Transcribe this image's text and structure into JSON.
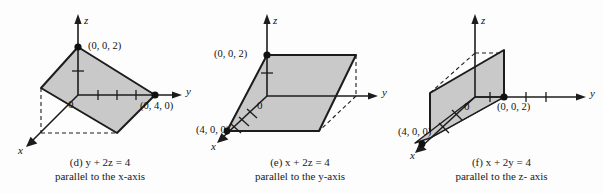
{
  "figure": {
    "panel_count": 3,
    "fill_color": "#c9c9c9",
    "stroke_color": "#1c1c1c",
    "background": "#fdfdfd"
  },
  "panels": [
    {
      "id": "d",
      "caption_line1": "(d)  y + 2z = 4",
      "caption_line2": "parallel to the x-axis",
      "equation": "y + 2z = 4",
      "parallel_axis": "x",
      "axes": {
        "x": "x",
        "y": "y",
        "z": "z"
      },
      "origin_label": "0",
      "points": [
        {
          "name": "z-intercept",
          "label": "(0, 0, 2)",
          "coords": [
            0,
            0,
            2
          ]
        },
        {
          "name": "y-intercept",
          "label": "(0, 4, 0)",
          "coords": [
            0,
            4,
            0
          ]
        }
      ],
      "y_axis_ticks": 3,
      "z_axis_ticks": 1,
      "plane_type": "tilted-parallelogram"
    },
    {
      "id": "e",
      "caption_line1": "(e)  x + 2z = 4",
      "caption_line2": "parallel to the y-axis",
      "equation": "x + 2z = 4",
      "parallel_axis": "y",
      "axes": {
        "x": "x",
        "y": "y",
        "z": "z"
      },
      "origin_label": "0",
      "points": [
        {
          "name": "z-intercept",
          "label": "(0, 0, 2)",
          "coords": [
            0,
            0,
            2
          ]
        },
        {
          "name": "x-intercept",
          "label": "(4, 0, 0)",
          "coords": [
            4,
            0,
            0
          ]
        }
      ],
      "x_axis_ticks": 3,
      "z_axis_ticks": 1,
      "plane_type": "tilted-parallelogram"
    },
    {
      "id": "f",
      "caption_line1": "(f)  x + 2y = 4",
      "caption_line2": "parallel to the z- axis",
      "equation": "x + 2y = 4",
      "parallel_axis": "z",
      "axes": {
        "x": "x",
        "y": "y",
        "z": "z"
      },
      "origin_label": "0",
      "points": [
        {
          "name": "y-intercept",
          "label": "(0, 0, 2)",
          "coords": [
            0,
            0,
            2
          ]
        },
        {
          "name": "x-intercept",
          "label": "(4, 0, 0)",
          "coords": [
            4,
            0,
            0
          ]
        }
      ],
      "y_axis_ticks": 3,
      "x_axis_ticks": 2,
      "plane_type": "vertical-parallelogram"
    }
  ]
}
